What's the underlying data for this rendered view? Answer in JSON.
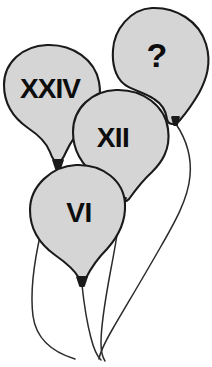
{
  "figure": {
    "background_color": "#ffffff",
    "balloon_fill_color": "#d5d5d5",
    "balloon_outline_color": "#1a1a1a",
    "label_color": "#0d0d0d",
    "string_color": "#2b2b2b"
  },
  "balloons": [
    {
      "id": "question",
      "label": "?",
      "label_x": 157,
      "label_y": 55,
      "font_size": 34,
      "letter_spacing": "0px",
      "name": "balloon-question",
      "body_path": "M 152 8 C 176 7 199 21 206 44 C 212 64 206 80 199 93 C 192 105 186 113 180 120 C 175 126 168 125 167 119 C 166 111 162 104 154 99 C 144 92 131 90 124 84 C 115 77 112 63 113 50 C 114 30 130 9 152 8 Z",
      "knot_path": "M 172 117 L 179 117 L 177 125 L 174 125 Z",
      "string_path": "M 176 124 C 186 139 192 155 190 176 C 188 199 175 222 160 248 C 144 276 126 306 112 330 C 104 344 100 353 99 359"
    },
    {
      "id": "xxiv",
      "label": "XXIV",
      "label_x": 50,
      "label_y": 88,
      "font_size": 28,
      "letter_spacing": "-1px",
      "name": "balloon-xxiv",
      "body_path": "M 47 45 C 73 44 95 60 99 82 C 103 103 94 116 86 124 C 77 133 70 143 66 152 C 63 159 61 162 58 162 C 54 162 52 158 50 152 C 46 141 37 134 28 128 C 15 119 4 105 4 85 C 4 62 23 46 47 45 Z",
      "knot_path": "M 53 160 L 63 160 L 60 169 L 56 169 Z",
      "string_path": "M 57 168 C 53 186 47 206 41 232 C 34 262 30 292 33 316 C 36 338 52 352 75 359"
    },
    {
      "id": "xii",
      "label": "XII",
      "label_x": 113,
      "label_y": 137,
      "font_size": 28,
      "letter_spacing": "-0.5px",
      "name": "balloon-xii",
      "body_path": "M 116 90 C 143 89 165 106 168 129 C 171 150 161 163 152 172 C 142 181 134 192 129 199 C 126 202 124 202 122 199 C 117 191 108 184 98 177 C 84 167 73 152 73 132 C 73 108 92 91 116 90 Z",
      "knot_path": "M 116 198 L 126 198 L 123 207 L 119 207 Z",
      "string_path": "M 121 206 C 119 226 115 248 110 274 C 105 301 101 327 101 343 C 101 353 103 358 105 361"
    },
    {
      "id": "vi",
      "label": "VI",
      "label_x": 79,
      "label_y": 212,
      "font_size": 28,
      "letter_spacing": "-0.5px",
      "name": "balloon-vi",
      "body_path": "M 76 165 C 103 164 124 181 125 204 C 126 225 116 239 107 249 C 97 259 90 270 86 278 C 83 282 81 282 79 278 C 74 269 65 262 55 255 C 41 245 30 230 30 210 C 30 186 52 166 76 165 Z",
      "knot_path": "M 77 277 L 87 277 L 84 286 L 80 286 Z",
      "string_path": "M 82 285 C 84 304 87 323 91 338 C 94 350 98 357 101 360"
    }
  ]
}
